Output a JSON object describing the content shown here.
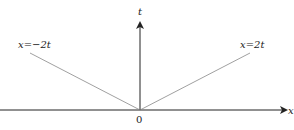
{
  "diagram": {
    "type": "characteristics-plot",
    "axes": {
      "horizontal": {
        "label": "x"
      },
      "vertical": {
        "label": "t"
      },
      "origin_label": "0"
    },
    "lines": [
      {
        "label": "x=−2t",
        "slope_desc": "left"
      },
      {
        "label": "x=2t",
        "slope_desc": "right"
      }
    ],
    "colors": {
      "axis": "#222222",
      "lines": "#888888",
      "background": "#ffffff"
    }
  }
}
